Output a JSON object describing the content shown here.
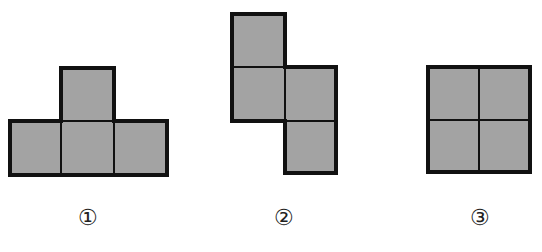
{
  "figure": {
    "cell_fill": "#a3a3a3",
    "outline_color": "#111111",
    "shapes": [
      {
        "id": 1,
        "label": "①",
        "description": "T-shaped arrangement of four squares"
      },
      {
        "id": 2,
        "label": "②",
        "description": "S/Z-shaped arrangement of four squares"
      },
      {
        "id": 3,
        "label": "③",
        "description": "2×2 square arrangement of four squares"
      }
    ]
  }
}
